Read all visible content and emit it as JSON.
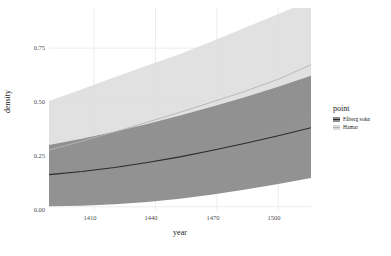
{
  "chart_data": {
    "type": "area",
    "title": "",
    "xlabel": "year",
    "ylabel": "density",
    "xlim": [
      1388,
      1516
    ],
    "ylim": [
      -0.02,
      0.94
    ],
    "xticks": [
      "1410",
      "1440",
      "1470",
      "1500"
    ],
    "xtick_values": [
      1410,
      1440,
      1470,
      1500
    ],
    "yticks": [
      "0.00",
      "0.25",
      "0.50",
      "0.75"
    ],
    "ytick_values": [
      0.0,
      0.25,
      0.5,
      0.75
    ],
    "grid": true,
    "legend_position": "right",
    "legend_title": "point",
    "x": [
      1388,
      1404,
      1420,
      1436,
      1452,
      1468,
      1484,
      1500,
      1516
    ],
    "series": [
      {
        "name": "Fåberg sokn",
        "color": "#8c8c8c",
        "line_color": "#2b2b2b",
        "values": [
          0.152,
          0.167,
          0.186,
          0.209,
          0.236,
          0.267,
          0.3,
          0.336,
          0.374
        ],
        "lower": [
          0.002,
          0.005,
          0.012,
          0.023,
          0.038,
          0.058,
          0.082,
          0.108,
          0.136
        ],
        "upper": [
          0.292,
          0.322,
          0.355,
          0.392,
          0.432,
          0.474,
          0.519,
          0.568,
          0.62
        ]
      },
      {
        "name": "Hamar",
        "color": "#dcdcdc",
        "line_color": "#b4b4b4",
        "values": [
          0.268,
          0.31,
          0.354,
          0.4,
          0.447,
          0.496,
          0.547,
          0.603,
          0.672
        ],
        "lower": [
          0.128,
          0.148,
          0.172,
          0.202,
          0.236,
          0.274,
          0.318,
          0.368,
          0.424
        ],
        "upper": [
          0.5,
          0.556,
          0.612,
          0.668,
          0.722,
          0.784,
          0.848,
          0.912,
          0.975
        ]
      }
    ]
  }
}
